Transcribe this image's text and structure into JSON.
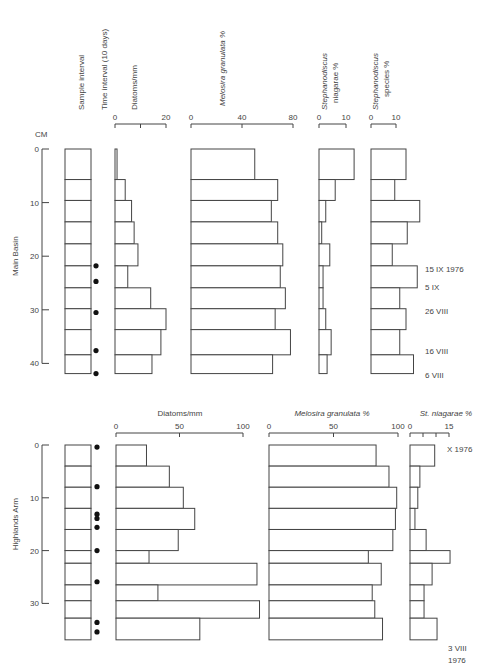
{
  "upper": {
    "panel_label": "Main Basin",
    "depth_unit": "CM",
    "depth_ticks": [
      "0",
      "10",
      "20",
      "30",
      "40"
    ],
    "column_headers": {
      "sample_interval": "Sample interval",
      "time_interval": "Time interval (10 days)",
      "diatoms": "Diatoms/mm",
      "melosira": "Melosira granulata %",
      "st_niagarae_line1": "Stephanodiscus",
      "st_niagarae_line2": "niagarae %",
      "st_species_line1": "Stephanodiscus",
      "st_species_line2": "species %"
    },
    "axis_ticks": {
      "diatoms": [
        "0",
        "20"
      ],
      "melosira": [
        "0",
        "40",
        "80"
      ],
      "st_niagarae": [
        "0",
        "10"
      ],
      "st_species": [
        "0",
        "10"
      ]
    },
    "date_labels": [
      "15 IX 1976",
      "5 IX",
      "26 VIII",
      "16 VIII",
      "6 VIII"
    ]
  },
  "lower": {
    "panel_label": "Highlands Arm",
    "depth_ticks": [
      "0",
      "10",
      "20",
      "30"
    ],
    "column_headers": {
      "diatoms": "Diatoms/mm",
      "melosira": "Melosira granulata %",
      "st_niagarae": "St. niagarae %"
    },
    "axis_ticks": {
      "diatoms": [
        "0",
        "50",
        "100"
      ],
      "melosira": [
        "0",
        "50",
        "100"
      ],
      "st_niagarae": [
        "0",
        "15"
      ]
    },
    "date_labels": [
      "X 1976",
      "3 VIII",
      "1976"
    ]
  },
  "chart_data": [
    {
      "type": "bar",
      "title": "Main Basin",
      "orientation": "horizontal",
      "ylabel": "Depth (CM)",
      "depth_intervals_cm": [
        [
          0,
          5.7
        ],
        [
          5.7,
          9.6
        ],
        [
          9.6,
          13.6
        ],
        [
          13.6,
          17.7
        ],
        [
          17.7,
          21.8
        ],
        [
          21.8,
          25.9
        ],
        [
          25.9,
          29.8
        ],
        [
          29.8,
          33.7
        ],
        [
          33.7,
          38.4
        ],
        [
          38.4,
          41.9
        ]
      ],
      "time_interval_markers_cm": [
        21.8,
        24.7,
        30.5,
        37.6,
        41.9
      ],
      "series": [
        {
          "name": "Diatoms/mm",
          "xlim": [
            0,
            20
          ],
          "values": [
            0.8,
            4,
            6.5,
            7.5,
            9,
            5,
            14,
            20,
            18,
            14.5
          ]
        },
        {
          "name": "Melosira granulata %",
          "xlim": [
            0,
            80
          ],
          "values": [
            50,
            68,
            63,
            68,
            72,
            70,
            74,
            66,
            78,
            64
          ]
        },
        {
          "name": "Stephanodiscus niagarae %",
          "xlim": [
            0,
            10
          ],
          "values": [
            13,
            6,
            2.5,
            1,
            4,
            1.5,
            1.5,
            2.5,
            4.5,
            3
          ]
        },
        {
          "name": "Stephanodiscus species %",
          "xlim": [
            0,
            10
          ],
          "values": [
            14,
            9.5,
            19.5,
            14.5,
            8.5,
            18.5,
            11.5,
            14,
            11.5,
            17
          ]
        }
      ],
      "annotations": [
        {
          "text": "15 IX 1976",
          "depth_cm": 22
        },
        {
          "text": "5 IX",
          "depth_cm": 25
        },
        {
          "text": "26 VIII",
          "depth_cm": 30.5
        },
        {
          "text": "16 VIII",
          "depth_cm": 37.6
        },
        {
          "text": "6 VIII",
          "depth_cm": 41.5
        }
      ]
    },
    {
      "type": "bar",
      "title": "Highlands Arm",
      "orientation": "horizontal",
      "ylabel": "Depth (CM)",
      "depth_intervals_cm": [
        [
          0,
          4
        ],
        [
          4,
          8
        ],
        [
          8,
          12
        ],
        [
          12,
          16
        ],
        [
          16,
          20
        ],
        [
          20,
          22.4
        ],
        [
          22.4,
          26.5
        ],
        [
          26.5,
          29.5
        ],
        [
          29.5,
          32.8
        ],
        [
          32.8,
          36.9
        ]
      ],
      "time_interval_markers_cm": [
        0.4,
        7.9,
        13.1,
        13.9,
        15.6,
        20,
        25.9,
        33.6,
        35.4
      ],
      "series": [
        {
          "name": "Diatoms/mm",
          "xlim": [
            0,
            100
          ],
          "values": [
            24,
            42,
            53,
            62,
            49,
            26,
            111,
            33,
            113,
            66
          ]
        },
        {
          "name": "Melosira granulata %",
          "xlim": [
            0,
            100
          ],
          "values": [
            83,
            93,
            99,
            98,
            96,
            77,
            87,
            80,
            82,
            88
          ]
        },
        {
          "name": "St. niagarae %",
          "xlim": [
            0,
            15
          ],
          "values": [
            9.5,
            3.8,
            3,
            1.9,
            6.2,
            15.4,
            8.5,
            5.4,
            5.4,
            10.4
          ]
        }
      ],
      "annotations": [
        {
          "text": "X 1976",
          "depth_cm": 0.5
        },
        {
          "text": "3 VIII 1976",
          "depth_cm": 38
        }
      ]
    }
  ]
}
